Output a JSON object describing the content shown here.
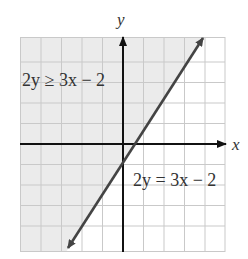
{
  "figure": {
    "type": "graph-of-linear-inequality",
    "axes": {
      "x_label": "x",
      "y_label": "y"
    },
    "grid": {
      "columns": 10,
      "rows": 10.5
    },
    "inequality_label": "2y ≥ 3x − 2",
    "boundary_label": "2y = 3x − 2",
    "boundary_line": {
      "equation": "2y = 3x - 2",
      "slope": 1.5,
      "y_intercept": -1,
      "x_intercept": 0.667,
      "style": "solid"
    },
    "shaded_region": "above-left of boundary line",
    "colors": {
      "grid_line": "#c8c8c8",
      "shade": "#ececec",
      "axis": "#111111",
      "boundary_line": "#444444",
      "text": "#333333"
    }
  }
}
